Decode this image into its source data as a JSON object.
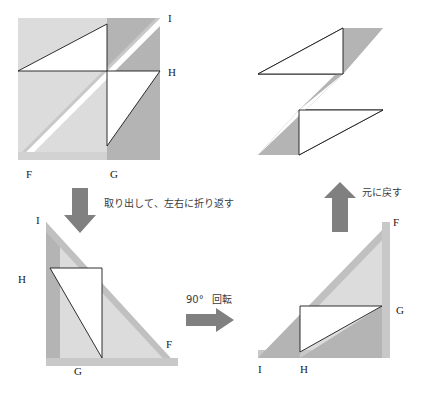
{
  "figure": {
    "background_color": "#ffffff",
    "colors": {
      "shade_dark": "#b4b4b4",
      "shade_light": "#dcdcdc",
      "outline": "#1a1a1a",
      "arrow": "#808080",
      "text": "#1a1a1a",
      "caption_text": "#3c3c3c"
    },
    "panels": [
      {
        "id": "top-left",
        "name": "folded-square-initial",
        "vertex_labels": [
          {
            "text": "I",
            "x": 168,
            "y": 22
          },
          {
            "text": "H",
            "x": 168,
            "y": 76
          },
          {
            "text": "F",
            "x": 26,
            "y": 178
          },
          {
            "text": "G",
            "x": 110,
            "y": 178
          }
        ]
      },
      {
        "id": "top-right",
        "name": "z-shape-result",
        "vertex_labels": []
      },
      {
        "id": "bottom-left",
        "name": "extracted-triangle-flipped",
        "vertex_labels": [
          {
            "text": "I",
            "x": 36,
            "y": 224
          },
          {
            "text": "H",
            "x": 18,
            "y": 283
          },
          {
            "text": "G",
            "x": 74,
            "y": 375
          },
          {
            "text": "F",
            "x": 166,
            "y": 348
          }
        ]
      },
      {
        "id": "bottom-right",
        "name": "rotated-triangle",
        "vertex_labels": [
          {
            "text": "F",
            "x": 393,
            "y": 226
          },
          {
            "text": "G",
            "x": 396,
            "y": 314
          },
          {
            "text": "I",
            "x": 258,
            "y": 369
          },
          {
            "text": "H",
            "x": 300,
            "y": 369
          }
        ]
      }
    ],
    "arrows": [
      {
        "name": "arrow-down-extract",
        "direction": "down",
        "label": "取り出して、左右に折り返す",
        "label_x": 104,
        "label_y": 207
      },
      {
        "name": "arrow-right-rotate",
        "direction": "right",
        "label": "回転",
        "angle_label": "90°",
        "label_x": 219,
        "label_y": 307
      },
      {
        "name": "arrow-up-restore",
        "direction": "up",
        "label": "元に戻す",
        "label_x": 351,
        "label_y": 196
      }
    ]
  }
}
